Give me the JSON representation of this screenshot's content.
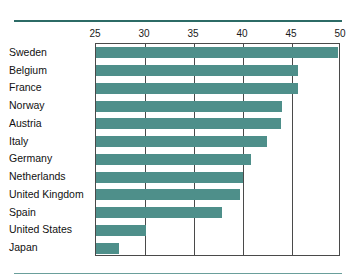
{
  "chart_data": {
    "type": "bar",
    "orientation": "horizontal",
    "title": "",
    "subtitle": "",
    "xlabel": "",
    "ylabel": "",
    "xlim": [
      25,
      50
    ],
    "ylim": null,
    "xticks": [
      25,
      30,
      35,
      40,
      45,
      50
    ],
    "tick_labels": [
      "25",
      "30",
      "35",
      "40",
      "45",
      "50"
    ],
    "grid": "vertical",
    "legend": null,
    "legend_position": "none",
    "bar_color": "#4e8f8a",
    "frame_color": "#4a4a4a",
    "categories": [
      "Sweden",
      "Belgium",
      "France",
      "Norway",
      "Austria",
      "Italy",
      "Germany",
      "Netherlands",
      "United Kingdom",
      "Spain",
      "United States",
      "Japan"
    ],
    "values": [
      49.7,
      45.6,
      45.6,
      44.0,
      43.9,
      42.4,
      40.8,
      40.0,
      39.7,
      37.9,
      30.1,
      27.3
    ],
    "series": [
      {
        "name": "",
        "values": [
          49.7,
          45.6,
          45.6,
          44.0,
          43.9,
          42.4,
          40.8,
          40.0,
          39.7,
          37.9,
          30.1,
          27.3
        ]
      }
    ],
    "annotations": []
  },
  "figure": {
    "top_rule_color": "#2c6b66",
    "bottom_rule_color": "#6a9f9b",
    "background": "#ffffff"
  }
}
